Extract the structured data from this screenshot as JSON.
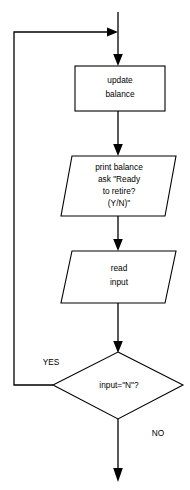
{
  "diagram": {
    "type": "flowchart",
    "background_color": "#ffffff",
    "line_color": "#000000",
    "text_color": "#000000"
  },
  "nodes": {
    "update_balance": {
      "shape": "rectangle",
      "lines": [
        "update",
        "balance"
      ],
      "line1": "update",
      "line2": "balance"
    },
    "print_balance": {
      "shape": "parallelogram",
      "lines": [
        "print balance",
        "ask \"Ready",
        "to retire?",
        "(Y/N)\""
      ],
      "line1": "print balance",
      "line2": "ask \"Ready",
      "line3": "to retire?",
      "line4": "(Y/N)\""
    },
    "read_input": {
      "shape": "parallelogram",
      "lines": [
        "read",
        "input"
      ],
      "line1": "read",
      "line2": "input"
    },
    "decision": {
      "shape": "diamond",
      "text": "input=\"N\"?"
    }
  },
  "edge_labels": {
    "yes": "YES",
    "no": "NO"
  }
}
